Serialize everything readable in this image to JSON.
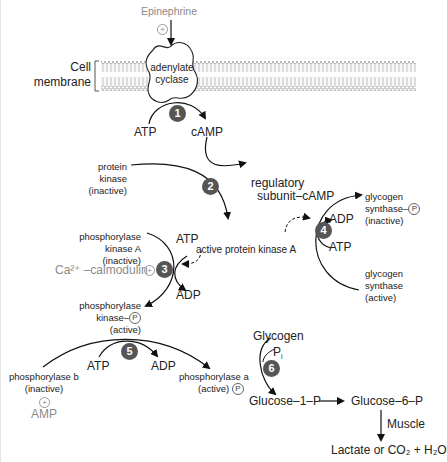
{
  "diagram": {
    "title_input": "Epinephrine",
    "membrane_label_1": "Cell",
    "membrane_label_2": "membrane",
    "enzyme_1": "adenylate",
    "enzyme_2": "cyclase",
    "steps": [
      "1",
      "2",
      "3",
      "4",
      "5",
      "6"
    ],
    "atp": "ATP",
    "adp": "ADP",
    "camp": "cAMP",
    "protein_kinase": [
      "protein",
      "kinase",
      "(inactive)"
    ],
    "regulatory": [
      "regulatory",
      "subunit–cAMP"
    ],
    "active_pka": "active protein kinase A",
    "gs_inactive": [
      "glycogen",
      "synthase–",
      "(inactive)"
    ],
    "gs_active": [
      "glycogen",
      "synthase",
      "(active)"
    ],
    "phk_inactive": [
      "phosphorylase",
      "kinase A",
      "(inactive)"
    ],
    "calmodulin": "Ca²⁺ –calmodulin",
    "phk_active": [
      "phosphorylase",
      "kinase–",
      "(active)"
    ],
    "phb": [
      "phosphorylase b",
      "(inactive)"
    ],
    "amp": "AMP",
    "pha": [
      "phosphorylase a",
      "(active)"
    ],
    "glycogen": "Glycogen",
    "pi": "P",
    "pi_sub": "i",
    "g1p": "Glucose–1–P",
    "g6p": "Glucose–6–P",
    "muscle": "Muscle",
    "end_product": "Lactate or CO₂ + H₂O",
    "phospho_symbol": "P",
    "plus_symbol": "+"
  },
  "colors": {
    "step_circle": "#555555",
    "activator_gray": "#8a8a8a",
    "line": "#111111"
  }
}
